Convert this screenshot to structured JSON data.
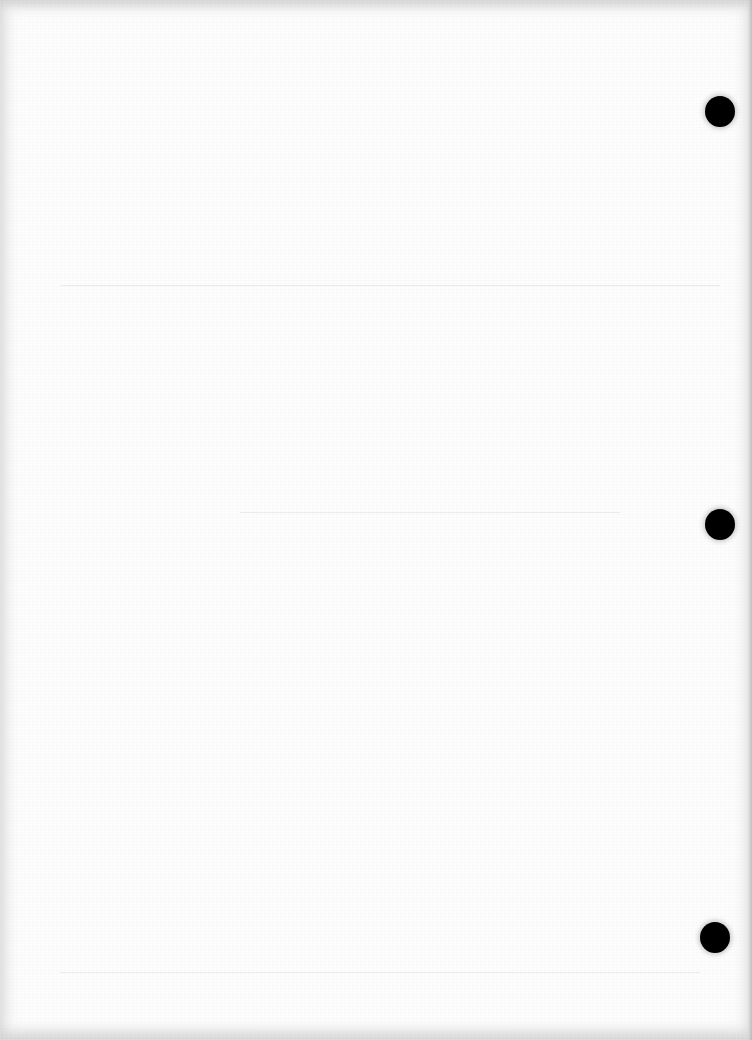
{
  "document": {
    "type": "blank scanned page",
    "text_content": "",
    "background_color": "#fdfdfd",
    "hole_color": "#000000",
    "punch_holes": [
      {
        "cx": 720,
        "cy": 111,
        "r": 15
      },
      {
        "cx": 720,
        "cy": 524,
        "r": 15
      },
      {
        "cx": 715,
        "cy": 937,
        "r": 15
      }
    ],
    "bleed_through_lines": [
      {
        "x": 60,
        "y": 285,
        "w": 660
      },
      {
        "x": 240,
        "y": 512,
        "w": 380
      },
      {
        "x": 60,
        "y": 972,
        "w": 640
      }
    ]
  }
}
